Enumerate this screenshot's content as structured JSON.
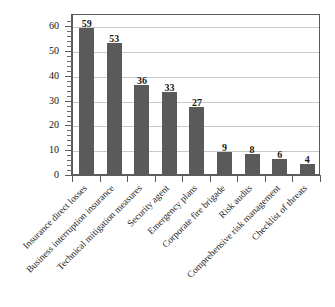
{
  "chart_data": {
    "type": "bar",
    "title": "",
    "subtitle": "",
    "xlabel": "",
    "ylabel": "",
    "ylim": [
      0,
      65
    ],
    "grid": true,
    "legend": false,
    "legend_position": "none",
    "orientation": "vertical",
    "bar_color": "#5a5a5a",
    "value_labels_shown": true,
    "categories": [
      "Insurance direct losses",
      "Business interruption insurance",
      "Technical mitigation measures",
      "Security agent",
      "Emergency plans",
      "Corporate fire brigade",
      "Risk audits",
      "Comprehensive risk management",
      "Checklist of threats"
    ],
    "values": [
      59,
      53,
      36,
      33,
      27,
      9,
      8,
      6,
      4
    ],
    "value_label_texts": [
      "59",
      "53",
      "36",
      "33",
      "27",
      "9",
      "8",
      "6",
      "4"
    ],
    "yticks": [
      0,
      10,
      20,
      30,
      40,
      50,
      60
    ],
    "ytick_labels": [
      "0",
      "10",
      "20",
      "30",
      "40",
      "50",
      "60"
    ],
    "ytick_minor_step": 2
  },
  "colors": {
    "bar": "#5a5a5a",
    "axis": "#5c5c5c",
    "grid": "#c9c9c9",
    "text": "#1a1a1a",
    "background": "#ffffff"
  }
}
